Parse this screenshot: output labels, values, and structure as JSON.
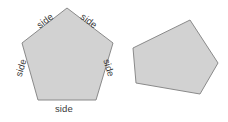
{
  "figure": {
    "background_color": "#ffffff",
    "shapes": [
      {
        "id": "regular-pentagon",
        "name": "regular-pentagon",
        "sides": 5,
        "fill_color": "#d2d2d2",
        "stroke_color": "#8a8a8a",
        "stroke_width": 1,
        "points": "67,8 113,43 96,100 38,100 22,43",
        "vertices": [
          {
            "x": 67,
            "y": 8
          },
          {
            "x": 113,
            "y": 43
          },
          {
            "x": 96,
            "y": 100
          },
          {
            "x": 38,
            "y": 100
          },
          {
            "x": 22,
            "y": 43
          }
        ],
        "edge_labels": [
          {
            "text": "side",
            "position": "top-left",
            "x": 36,
            "y": 16,
            "rotation": -37
          },
          {
            "text": "side",
            "position": "top-right",
            "x": 80,
            "y": 16,
            "rotation": 37
          },
          {
            "text": "side",
            "position": "right",
            "x": 100,
            "y": 63,
            "rotation": 73
          },
          {
            "text": "side",
            "position": "bottom",
            "x": 55,
            "y": 104,
            "rotation": 0
          },
          {
            "text": "side",
            "position": "left",
            "x": 12,
            "y": 63,
            "rotation": -73
          }
        ]
      },
      {
        "id": "irregular-pentagon",
        "name": "irregular-pentagon",
        "sides": 5,
        "fill_color": "#d2d2d2",
        "stroke_color": "#8a8a8a",
        "stroke_width": 1,
        "points": "190,20 218,63 200,94 136,83 133,48",
        "vertices": [
          {
            "x": 190,
            "y": 20
          },
          {
            "x": 218,
            "y": 63
          },
          {
            "x": 200,
            "y": 94
          },
          {
            "x": 136,
            "y": 83
          },
          {
            "x": 133,
            "y": 48
          }
        ],
        "edge_labels": []
      }
    ]
  }
}
